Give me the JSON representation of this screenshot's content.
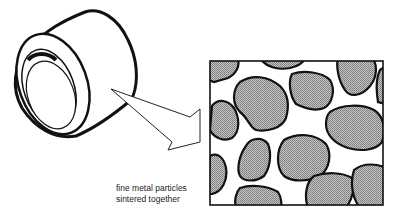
{
  "diagram": {
    "caption": {
      "line1": "fine metal particles",
      "line2": "sintered together"
    },
    "colors": {
      "line": "#111111",
      "particle_fill": "#a8a8a8",
      "background": "#ffffff"
    },
    "elements": [
      {
        "id": "bushing",
        "label": "cylindrical bushing"
      },
      {
        "id": "magnify-arrow",
        "label": "arrow pointing to magnified view"
      },
      {
        "id": "magnified-view",
        "label": "magnified microstructure box"
      }
    ]
  }
}
